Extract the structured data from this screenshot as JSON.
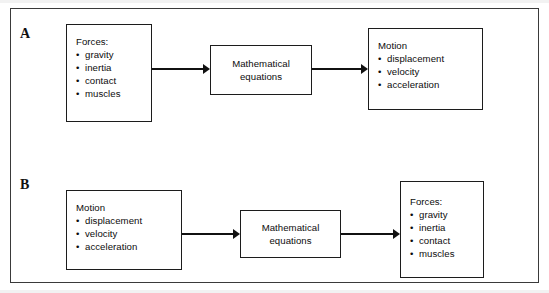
{
  "figure": {
    "panels": [
      {
        "label": "A",
        "nodes": [
          {
            "name": "forces-box",
            "title": "Forces:",
            "items": [
              "gravity",
              "inertia",
              "contact",
              "muscles"
            ]
          },
          {
            "name": "mathematical-equations-box",
            "lines": [
              "Mathematical",
              "equations"
            ]
          },
          {
            "name": "motion-box",
            "title": "Motion",
            "items": [
              "displacement",
              "velocity",
              "acceleration"
            ]
          }
        ],
        "arrows": [
          {
            "name": "arrow-forces-to-equations"
          },
          {
            "name": "arrow-equations-to-motion"
          }
        ]
      },
      {
        "label": "B",
        "nodes": [
          {
            "name": "motion-box",
            "title": "Motion",
            "items": [
              "displacement",
              "velocity",
              "acceleration"
            ]
          },
          {
            "name": "mathematical-equations-box",
            "lines": [
              "Mathematical",
              "equations"
            ]
          },
          {
            "name": "forces-box",
            "title": "Forces:",
            "items": [
              "gravity",
              "inertia",
              "contact",
              "muscles"
            ]
          }
        ],
        "arrows": [
          {
            "name": "arrow-motion-to-equations"
          },
          {
            "name": "arrow-equations-to-forces"
          }
        ]
      }
    ],
    "bullet_glyph": "•",
    "colors": {
      "stroke": "#1c1c1c",
      "text": "#0c0c0c",
      "frame": "#3a3a3a",
      "background": "#ffffff"
    }
  }
}
